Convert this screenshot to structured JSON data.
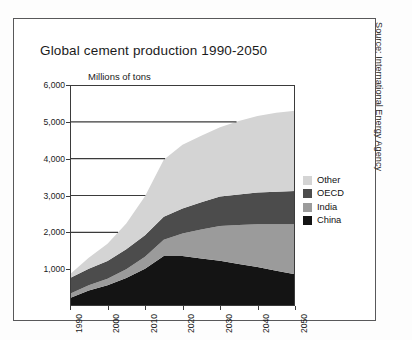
{
  "figure": {
    "title": "Global cement production 1990-2050",
    "unit_label": "Millions of tons",
    "source": "Source: International Energy Agency"
  },
  "legend": {
    "items": [
      {
        "label": "Other",
        "color": "#d4d4d4"
      },
      {
        "label": "OECD",
        "color": "#4c4c4c"
      },
      {
        "label": "India",
        "color": "#9b9b9b"
      },
      {
        "label": "China",
        "color": "#141414"
      }
    ]
  },
  "axes": {
    "y_ticks": [
      "1,000",
      "2,000",
      "3,000",
      "4,000",
      "5,000",
      "6,000"
    ],
    "x_ticks": [
      "1990",
      "2000",
      "2010",
      "2020",
      "2030",
      "2040",
      "2050"
    ]
  },
  "chart_data": {
    "type": "area",
    "title": "Global cement production 1990-2050",
    "subtitle": "Millions of tons",
    "xlabel": "",
    "ylabel": "Millions of tons",
    "stacked": true,
    "grid": true,
    "legend_position": "right",
    "xlim": [
      1990,
      2050
    ],
    "ylim": [
      0,
      6000
    ],
    "x": [
      1990,
      1995,
      2000,
      2005,
      2010,
      2015,
      2020,
      2025,
      2030,
      2035,
      2040,
      2045,
      2050
    ],
    "series": [
      {
        "name": "China",
        "color": "#141414",
        "values": [
          220,
          420,
          560,
          760,
          1010,
          1360,
          1360,
          1290,
          1230,
          1140,
          1060,
          960,
          860
        ]
      },
      {
        "name": "India",
        "color": "#9b9b9b",
        "values": [
          110,
          140,
          180,
          240,
          330,
          440,
          610,
          790,
          940,
          1060,
          1160,
          1260,
          1360
        ]
      },
      {
        "name": "OECD",
        "color": "#4c4c4c",
        "values": [
          430,
          450,
          480,
          540,
          580,
          620,
          680,
          740,
          800,
          830,
          860,
          880,
          900
        ]
      },
      {
        "name": "Other",
        "color": "#d4d4d4",
        "values": [
          100,
          300,
          470,
          700,
          1060,
          1550,
          1730,
          1800,
          1880,
          1990,
          2080,
          2150,
          2180
        ]
      }
    ],
    "totals": [
      860,
      1310,
      1690,
      2240,
      2980,
      3970,
      4380,
      4620,
      4850,
      5020,
      5160,
      5250,
      5300
    ],
    "gridlines": [
      2000,
      3000,
      4000,
      5000,
      6000
    ]
  }
}
